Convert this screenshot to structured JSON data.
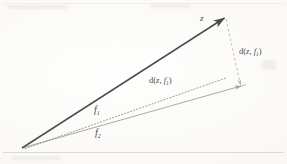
{
  "figure": {
    "kind": "vector-distance-diagram",
    "background_color": "#fbfaf7",
    "width": 287,
    "height": 164
  },
  "labels": {
    "z": {
      "base": "z",
      "sub": ""
    },
    "f1": {
      "base": "f",
      "sub": "1"
    },
    "f2": {
      "base": "f",
      "sub": "2"
    },
    "d_right": {
      "prefix": "d(",
      "arg1": "z",
      "comma": ", ",
      "arg2": "f",
      "sub": "1",
      "suffix": ")"
    },
    "d_center": {
      "prefix": "d(",
      "arg1": "z",
      "comma": ", ",
      "arg2": "f",
      "sub": "1",
      "suffix": ")"
    }
  },
  "geometry": {
    "origin": {
      "x": 22,
      "y": 148
    },
    "z_tip": {
      "x": 226,
      "y": 17
    },
    "f2_tip": {
      "x": 243,
      "y": 86
    },
    "f1_arrow_at": {
      "x": 103,
      "y": 100
    },
    "z_color": "#4f4f4f",
    "f2_color": "#9a9a96",
    "f1_color": "#8f8f8c",
    "dash_color": "#b0b0ab"
  },
  "border_lines": {
    "bottom_y": 152,
    "top_y": 3
  }
}
